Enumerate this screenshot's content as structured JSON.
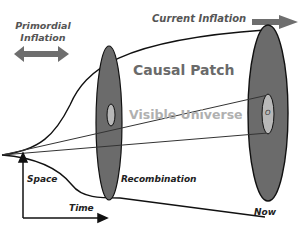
{
  "labels": {
    "primordial_inflation": [
      "Primordial",
      "Inflation"
    ],
    "current_inflation": "Current Inflation",
    "causal_patch": "Causal Patch",
    "visible_universe": "Visible Universe",
    "observer": "O",
    "recombination": "Recombination",
    "now": "Now",
    "axis_space": "Space",
    "axis_time": "Time"
  },
  "colors": {
    "disk_fill": "#6b6b6b",
    "inner_fill": "#b8b8b8",
    "outline": "#111111",
    "arrow": "#6e6e6e",
    "causal_text": "#6a6a6a",
    "visible_text": "#b0b0b0",
    "label_text": "#222222"
  }
}
